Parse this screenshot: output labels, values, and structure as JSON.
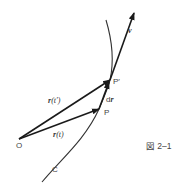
{
  "figure": {
    "caption": "図 2–1",
    "stroke_color": "#1a1a1a",
    "text_color": "#333333"
  },
  "points": {
    "origin": {
      "label": "O",
      "x": 19,
      "y": 139
    },
    "P": {
      "label": "P",
      "x": 99,
      "y": 109
    },
    "P_prime": {
      "label": "P′",
      "x": 110,
      "y": 80
    }
  },
  "curve": {
    "label": "C"
  },
  "vectors": {
    "r_t": {
      "label_main": "r",
      "label_arg": "(t)"
    },
    "r_t_prime": {
      "label_main": "r",
      "label_arg": "(t′)"
    },
    "dr": {
      "label_prefix": "d",
      "label_main": "r"
    },
    "v": {
      "label": "v"
    }
  }
}
